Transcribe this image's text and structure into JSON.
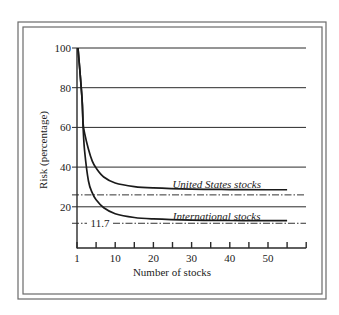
{
  "chart_data": {
    "type": "line",
    "title": "",
    "xlabel": "Number of stocks",
    "ylabel": "Risk (percentage)",
    "xlim": [
      0,
      60
    ],
    "ylim": [
      0,
      100
    ],
    "x_ticks": [
      1,
      5,
      10,
      15,
      20,
      25,
      30,
      35,
      40,
      45,
      50,
      55,
      60
    ],
    "x_tick_labels": [
      {
        "value": 1,
        "label": "1"
      },
      {
        "value": 10,
        "label": "10"
      },
      {
        "value": 20,
        "label": "20"
      },
      {
        "value": 30,
        "label": "30"
      },
      {
        "value": 40,
        "label": "40"
      },
      {
        "value": 50,
        "label": "50"
      }
    ],
    "y_ticks": [
      20,
      40,
      60,
      80,
      100
    ],
    "y_tick_labels": [
      "20",
      "40",
      "60",
      "80",
      "100"
    ],
    "grid": "horizontal",
    "series": [
      {
        "name": "United States stocks",
        "x": [
          1,
          1.3,
          1.6,
          2,
          3,
          4,
          5,
          7,
          10,
          15,
          20,
          30,
          40,
          50,
          55
        ],
        "values": [
          100,
          75,
          62,
          57,
          49,
          43,
          39.5,
          35,
          32,
          30.2,
          29.5,
          28.9,
          28.7,
          28.6,
          28.6
        ],
        "asymptote": 26
      },
      {
        "name": "International stocks",
        "x": [
          1,
          1.3,
          1.6,
          2,
          3,
          4,
          5,
          7,
          10,
          15,
          20,
          30,
          40,
          50,
          55
        ],
        "values": [
          100,
          75,
          60,
          48,
          33,
          27,
          23.5,
          19.5,
          16.5,
          14.6,
          13.9,
          13.3,
          13.1,
          13,
          13
        ],
        "asymptote": 11.7
      }
    ],
    "reference_lines": [
      {
        "y": 26,
        "style": "dash-dot",
        "label": ""
      },
      {
        "y": 11.7,
        "style": "dash-dot",
        "label": "11.7"
      }
    ],
    "annotations": [
      {
        "text": "United States stocks",
        "x": 35,
        "y": 31
      },
      {
        "text": "International stocks",
        "x": 35,
        "y": 15
      },
      {
        "text": "11.7",
        "x": 3,
        "y": 11.7
      }
    ]
  }
}
